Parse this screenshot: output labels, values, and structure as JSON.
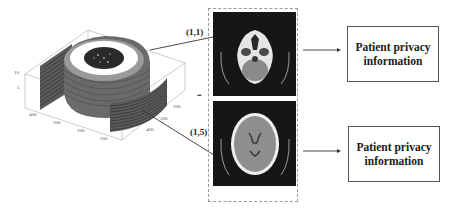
{
  "figure": {
    "volume_plot": {
      "description": "3D stacked CT slice volume",
      "z_ticks": [
        "10",
        "5"
      ],
      "x_ticks": [
        "400",
        "300",
        "200",
        "100"
      ],
      "y_ticks": [
        "200",
        "300",
        "400"
      ]
    },
    "slice_labels": [
      {
        "label": "(1,1)"
      },
      {
        "label": "(1,5)"
      }
    ],
    "ellipsis_left": "...",
    "ct_images": [
      {
        "name": "ct-slice-1-1",
        "view": "skull base axial slice"
      },
      {
        "name": "ct-slice-1-5",
        "view": "brain ventricles axial slice"
      }
    ],
    "info_boxes": [
      {
        "text_line1": "Patient privacy",
        "text_line2": "information"
      },
      {
        "text_line1": "Patient privacy",
        "text_line2": "information"
      }
    ],
    "colors": {
      "line": "#333333",
      "ct_background": "#161616",
      "frame_dashed": "#9a9a9a"
    }
  }
}
